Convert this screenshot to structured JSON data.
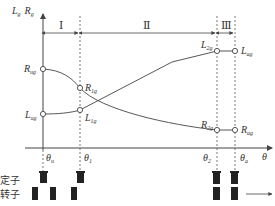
{
  "axes": {
    "y_label_L": "L",
    "y_label_L_sub": "g",
    "y_label_R": "R",
    "y_label_R_sub": "g",
    "x_label": "θ"
  },
  "regions": [
    {
      "label": "Ⅰ"
    },
    {
      "label": "Ⅱ"
    },
    {
      "label": "Ⅲ"
    }
  ],
  "angles": [
    {
      "name": "θ",
      "sub": "u"
    },
    {
      "name": "θ",
      "sub": "1"
    },
    {
      "name": "θ",
      "sub": "2"
    },
    {
      "name": "θ",
      "sub": "a"
    }
  ],
  "points": {
    "R_ug": {
      "main": "R",
      "sub": "ug"
    },
    "L_ug": {
      "main": "L",
      "sub": "ug"
    },
    "R_1g": {
      "main": "R",
      "sub": "1g"
    },
    "L_1g": {
      "main": "L",
      "sub": "1g"
    },
    "L_2g": {
      "main": "L",
      "sub": "2g"
    },
    "R_2g": {
      "main": "R",
      "sub": "2g"
    },
    "L_ag": {
      "main": "L",
      "sub": "ag"
    },
    "R_ag": {
      "main": "R",
      "sub": "ag"
    }
  },
  "legend": {
    "stator": "定子",
    "rotor": "转子"
  }
}
